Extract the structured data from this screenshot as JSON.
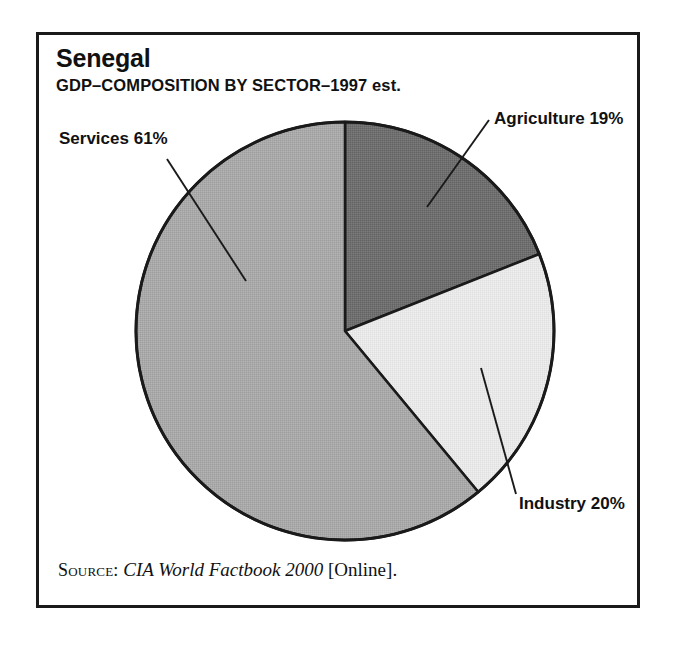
{
  "chart_data": {
    "type": "pie",
    "title": "Senegal",
    "subtitle": "GDP–COMPOSITION BY SECTOR–1997 est.",
    "xlabel": "",
    "ylabel": "",
    "grid": false,
    "legend": "none",
    "labels_position": "outside-with-leader-lines",
    "start_angle_deg": 0,
    "direction": "clockwise",
    "units": "percent",
    "categories": [
      "Agriculture",
      "Industry",
      "Services"
    ],
    "values": [
      19,
      20,
      61
    ],
    "slices": [
      {
        "name": "Agriculture",
        "value": 19,
        "label": "Agriculture 19%",
        "color": "#6f6f6f",
        "start_deg": 0,
        "end_deg": 68.4
      },
      {
        "name": "Industry",
        "value": 20,
        "label": "Industry 20%",
        "color": "#e6e6e6",
        "start_deg": 68.4,
        "end_deg": 140.4
      },
      {
        "name": "Services",
        "value": 61,
        "label": "Services 61%",
        "color": "#a9a9a9",
        "start_deg": 140.4,
        "end_deg": 360
      }
    ],
    "annotations": [
      "Agriculture 19%",
      "Industry 20%",
      "Services 61%"
    ]
  },
  "frame": {
    "border_color": "#1a1a1a"
  },
  "header": {
    "title": "Senegal",
    "subtitle": "GDP–COMPOSITION BY SECTOR–1997 est."
  },
  "pie": {
    "center_x": 345,
    "center_y": 331,
    "radius": 209,
    "outline_color": "#1a1a1a",
    "leader_color": "#1a1a1a"
  },
  "labels": {
    "agriculture": "Agriculture 19%",
    "industry": "Industry 20%",
    "services": "Services 61%"
  },
  "source": {
    "kicker": "Source:",
    "work": "CIA World Factbook 2000",
    "medium": "[Online]."
  }
}
